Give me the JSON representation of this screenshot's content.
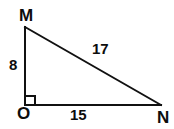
{
  "diagram": {
    "kind": "right-triangle",
    "background_color": "#ffffff",
    "stroke_color": "#111111",
    "stroke_width": 2,
    "vertices": [
      {
        "name": "M",
        "label": "M",
        "x": 25,
        "y": 27
      },
      {
        "name": "O",
        "label": "O",
        "x": 25,
        "y": 105
      },
      {
        "name": "N",
        "label": "N",
        "x": 161,
        "y": 105
      }
    ],
    "sides": [
      {
        "name": "MO",
        "label": "8",
        "from": "M",
        "to": "O"
      },
      {
        "name": "ON",
        "label": "15",
        "from": "O",
        "to": "N"
      },
      {
        "name": "MN",
        "label": "17",
        "from": "M",
        "to": "N"
      }
    ],
    "right_angle": {
      "at_vertex": "O",
      "marker": "square",
      "x": 26,
      "y": 96,
      "size": 9
    }
  }
}
